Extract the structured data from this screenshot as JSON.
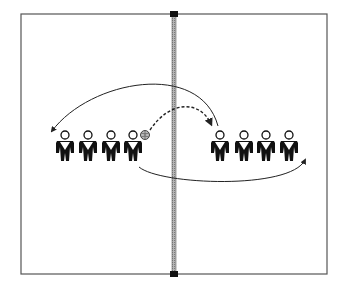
{
  "diagram": {
    "type": "volleyball drill",
    "court": {
      "x": 21,
      "y": 14,
      "width": 306,
      "height": 260,
      "stroke": "#555555"
    },
    "net": {
      "x": 174,
      "top": 14,
      "bottom": 274,
      "color": "#9a9a9a"
    },
    "left_team": [
      {
        "id": "L1",
        "x": 65
      },
      {
        "id": "L2",
        "x": 88
      },
      {
        "id": "L3",
        "x": 111
      },
      {
        "id": "L4",
        "x": 133
      }
    ],
    "right_team": [
      {
        "id": "R1",
        "x": 220
      },
      {
        "id": "R2",
        "x": 244
      },
      {
        "id": "R3",
        "x": 266
      },
      {
        "id": "R4",
        "x": 289
      }
    ],
    "players_y": 134,
    "ball": {
      "x": 145,
      "y": 135,
      "holder": "L4"
    },
    "paths": [
      {
        "name": "ball-pass",
        "style": "dashed",
        "from": "L4",
        "to": "R1"
      },
      {
        "name": "player-return-run",
        "style": "solid",
        "from": "R1",
        "to": "left-end"
      },
      {
        "name": "player-follow-run",
        "style": "solid",
        "from": "L4",
        "to": "right-end"
      }
    ]
  }
}
